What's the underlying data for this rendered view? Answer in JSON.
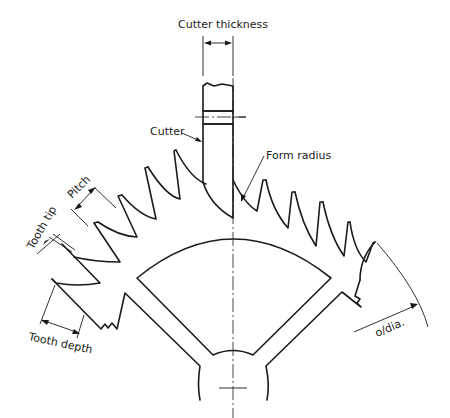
{
  "figure": {
    "colors": {
      "line": "#1a1a1a",
      "text": "#222222",
      "background": "#ffffff"
    }
  },
  "labels": {
    "cutter_thickness": "Cutter thickness",
    "cutter": "Cutter",
    "form_radius": "Form radius",
    "pitch": "Pitch",
    "tooth_tip": "Tooth tip",
    "tooth_depth": "Tooth depth",
    "outside_diameter": "o/dia."
  }
}
